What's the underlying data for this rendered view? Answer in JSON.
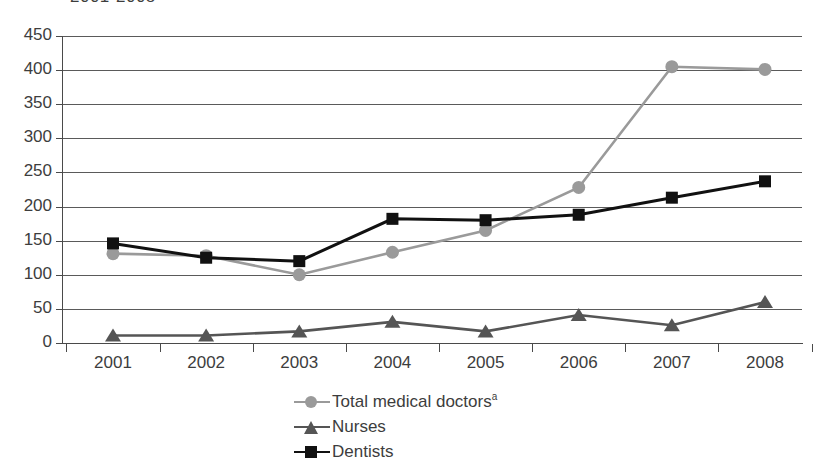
{
  "chart_data": {
    "type": "line",
    "title": "2001-2008",
    "xlabel": "",
    "ylabel": "",
    "x": [
      2001,
      2002,
      2003,
      2004,
      2005,
      2006,
      2007,
      2008
    ],
    "categories": [
      "2001",
      "2002",
      "2003",
      "2004",
      "2005",
      "2006",
      "2007",
      "2008"
    ],
    "ylim": [
      0,
      450
    ],
    "ytick_step": 50,
    "yticks": [
      "450",
      "400",
      "350",
      "300",
      "250",
      "200",
      "150",
      "100",
      "50",
      "0"
    ],
    "grid": true,
    "legend_position": "bottom-center",
    "series": [
      {
        "name": "Total medical doctors",
        "name_superscript": "a",
        "marker": "circle",
        "color": "#9a9a9a",
        "values": [
          131,
          128,
          100,
          133,
          165,
          228,
          405,
          401
        ]
      },
      {
        "name": "Nurses",
        "name_superscript": "",
        "marker": "triangle",
        "color": "#555555",
        "values": [
          11,
          11,
          17,
          31,
          17,
          41,
          26,
          60
        ]
      },
      {
        "name": "Dentists",
        "name_superscript": "",
        "marker": "square",
        "color": "#111111",
        "values": [
          146,
          125,
          120,
          182,
          180,
          188,
          213,
          237
        ]
      }
    ]
  },
  "legend": {
    "items": [
      {
        "label": "Total medical doctors",
        "superscript": "a"
      },
      {
        "label": "Nurses",
        "superscript": ""
      },
      {
        "label": "Dentists",
        "superscript": ""
      }
    ]
  },
  "colors": {
    "doctors": "#9a9a9a",
    "nurses": "#555555",
    "dentists": "#111111",
    "grid": "#5a5a5a",
    "axis": "#4a4a4a",
    "text": "#3d3d3d",
    "background": "#ffffff"
  }
}
